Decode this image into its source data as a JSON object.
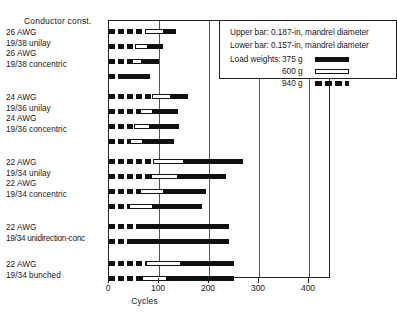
{
  "header": {
    "column_title": "Conductor const."
  },
  "legend": {
    "note_upper": "Upper bar: 0.187-in, mandrel diameter",
    "note_lower": "Lower bar: 0.157-in, mandrel diameter",
    "load_title": "Load weights:",
    "entries": [
      {
        "label": "375 g",
        "key": "solid"
      },
      {
        "label": "600 g",
        "key": "hollow"
      },
      {
        "label": "940 g",
        "key": "dash"
      }
    ]
  },
  "chart_data": {
    "type": "bar",
    "orientation": "horizontal",
    "title": "",
    "xlabel": "Cycles",
    "ylabel": "Conductor const.",
    "xlim": [
      0,
      444
    ],
    "xticks": [
      0,
      100,
      200,
      300,
      400
    ],
    "xticklabels": [
      "0",
      "100",
      "200",
      "300",
      "400"
    ],
    "grid": "vertical-at-100-200-300-400",
    "legend_position": "top-right",
    "stack_order": [
      "940 g",
      "600 g",
      "375 g"
    ],
    "series": [
      {
        "name": "940 g",
        "style": "dashed"
      },
      {
        "name": "600 g",
        "style": "hollow"
      },
      {
        "name": "375 g",
        "style": "solid"
      }
    ],
    "groups": [
      {
        "labels": [
          "26 AWG",
          "19/38 unilay",
          "26 AWG",
          "19/38 concentric"
        ],
        "bars": [
          {
            "mandrel": "0.187-in",
            "rows": [
              "26 AWG",
              "19/38 unilay"
            ],
            "segments": [
              72,
              38,
              24
            ],
            "total": 134
          },
          {
            "mandrel": "0.157-in",
            "rows": [
              "26 AWG",
              "19/38 unilay"
            ],
            "segments": [
              52,
              26,
              30
            ],
            "total": 108
          },
          {
            "mandrel": "0.187-in",
            "rows": [
              "26 AWG",
              "19/38 concentric"
            ],
            "segments": [
              46,
              20,
              34
            ],
            "total": 100
          },
          {
            "mandrel": "0.157-in",
            "rows": [
              "26 AWG",
              "19/38 concentric"
            ],
            "segments": [
              20,
              0,
              62
            ],
            "total": 82
          }
        ]
      },
      {
        "labels": [
          "24 AWG",
          "19/36 unilay",
          "24 AWG",
          "19/36 concentric"
        ],
        "bars": [
          {
            "mandrel": "0.187-in",
            "rows": [
              "24 AWG",
              "19/36 unilay"
            ],
            "segments": [
              86,
              38,
              34
            ],
            "total": 158
          },
          {
            "mandrel": "0.157-in",
            "rows": [
              "24 AWG",
              "19/36 unilay"
            ],
            "segments": [
              62,
              26,
              50
            ],
            "total": 138
          },
          {
            "mandrel": "0.187-in",
            "rows": [
              "24 AWG",
              "19/36 concentric"
            ],
            "segments": [
              50,
              32,
              58
            ],
            "total": 140
          },
          {
            "mandrel": "0.157-in",
            "rows": [
              "24 AWG",
              "19/36 concentric"
            ],
            "segments": [
              42,
              26,
              62
            ],
            "total": 130
          }
        ]
      },
      {
        "labels": [
          "22 AWG",
          "19/34 unilay",
          "22 AWG",
          "19/34 concentric"
        ],
        "bars": [
          {
            "mandrel": "0.187-in",
            "rows": [
              "22 AWG",
              "19/34 unilay"
            ],
            "segments": [
              88,
              62,
              118
            ],
            "total": 268
          },
          {
            "mandrel": "0.157-in",
            "rows": [
              "22 AWG",
              "19/34 unilay"
            ],
            "segments": [
              84,
              54,
              96
            ],
            "total": 234
          },
          {
            "mandrel": "0.187-in",
            "rows": [
              "22 AWG",
              "19/34 concentric"
            ],
            "segments": [
              62,
              48,
              84
            ],
            "total": 194
          },
          {
            "mandrel": "0.157-in",
            "rows": [
              "22 AWG",
              "19/34 concentric"
            ],
            "segments": [
              40,
              48,
              98
            ],
            "total": 186
          }
        ]
      },
      {
        "labels": [
          "22 AWG",
          "19/34 unidirection-conc"
        ],
        "bars": [
          {
            "mandrel": "0.187-in",
            "rows": [
              "22 AWG",
              "19/34 unidirection-conc"
            ],
            "segments": [
              62,
              0,
              178
            ],
            "total": 240
          },
          {
            "mandrel": "0.157-in",
            "rows": [
              "22 AWG",
              "19/34 unidirection-conc"
            ],
            "segments": [
              44,
              0,
              196
            ],
            "total": 240
          }
        ]
      },
      {
        "labels": [
          "22 AWG",
          "19/34 bunched"
        ],
        "bars": [
          {
            "mandrel": "0.187-in",
            "rows": [
              "22 AWG",
              "19/34 bunched"
            ],
            "segments": [
              74,
              70,
              106
            ],
            "total": 250
          },
          {
            "mandrel": "0.157-in",
            "rows": [
              "22 AWG",
              "19/34 bunched"
            ],
            "segments": [
              66,
              50,
              134
            ],
            "total": 250
          }
        ]
      }
    ]
  }
}
